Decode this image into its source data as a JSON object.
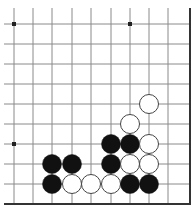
{
  "board": {
    "description": "Go board diagram, lower-right corner region",
    "columns_x": [
      14,
      33,
      52,
      72,
      91,
      111,
      130,
      149,
      168
    ],
    "rows_y": [
      24,
      44,
      64,
      84,
      104,
      124,
      144,
      164,
      184
    ],
    "right_edge_x": 190,
    "bottom_edge_y": 204,
    "line_color": "#8a8a8a",
    "edge_color": "#333333",
    "stone_radius": 9.5,
    "black_color": "#111111",
    "white_color": "#ffffff",
    "star_points": [
      [
        0,
        0
      ],
      [
        6,
        0
      ],
      [
        0,
        6
      ]
    ],
    "stones": [
      {
        "color": "white",
        "col": 7,
        "row": 4
      },
      {
        "color": "white",
        "col": 6,
        "row": 5
      },
      {
        "color": "black",
        "col": 5,
        "row": 6
      },
      {
        "color": "black",
        "col": 6,
        "row": 6
      },
      {
        "color": "white",
        "col": 7,
        "row": 6
      },
      {
        "color": "black",
        "col": 2,
        "row": 7
      },
      {
        "color": "black",
        "col": 3,
        "row": 7
      },
      {
        "color": "black",
        "col": 5,
        "row": 7
      },
      {
        "color": "white",
        "col": 6,
        "row": 7
      },
      {
        "color": "white",
        "col": 7,
        "row": 7
      },
      {
        "color": "black",
        "col": 2,
        "row": 8
      },
      {
        "color": "white",
        "col": 3,
        "row": 8
      },
      {
        "color": "white",
        "col": 4,
        "row": 8
      },
      {
        "color": "white",
        "col": 5,
        "row": 8
      },
      {
        "color": "black",
        "col": 6,
        "row": 8
      },
      {
        "color": "black",
        "col": 7,
        "row": 8
      }
    ]
  }
}
